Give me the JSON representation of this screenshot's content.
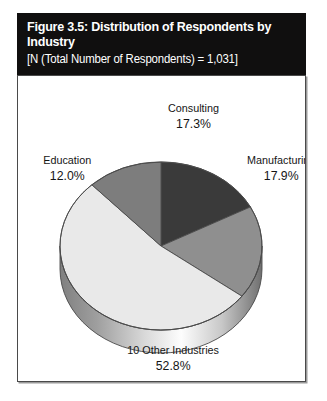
{
  "figure": {
    "title": "Figure 3.5: Distribution of Respondents by Industry",
    "subtitle": "[N (Total Number of Respondents) = 1,031]",
    "header_bg": "#100f0f",
    "header_fg": "#ffffff",
    "frame_border": "#4a4a4a",
    "frame_bg": "#ffffff"
  },
  "chart_data": {
    "type": "pie",
    "title": "Figure 3.5: Distribution of Respondents by Industry",
    "subtitle": "[N (Total Number of Respondents) = 1,031]",
    "total_n": 1031,
    "three_d": true,
    "legend": "none",
    "labels_position": "outside",
    "categories": [
      "Consulting",
      "Manufacturing",
      "10 Other Industries",
      "Education"
    ],
    "values": [
      17.3,
      17.9,
      52.8,
      12.0
    ],
    "value_labels": [
      "17.3%",
      "17.9%",
      "52.8%",
      "12.0%"
    ],
    "colors": [
      "#3a3a3a",
      "#8f8f8f",
      "#e9e9e9",
      "#7d7d7d"
    ],
    "slices": [
      {
        "name": "Consulting",
        "value": 17.3,
        "value_label": "17.3%",
        "color": "#3a3a3a",
        "label_x": 164,
        "label_y": 36
      },
      {
        "name": "Manufacturing",
        "value": 17.9,
        "value_label": "17.9%",
        "color": "#8f8f8f",
        "label_x": 246,
        "label_y": 88
      },
      {
        "name": "10 Other Industries",
        "value": 52.8,
        "value_label": "52.8%",
        "color": "#e9e9e9",
        "label_x": 145,
        "label_y": 278
      },
      {
        "name": "Education",
        "value": 12.0,
        "value_label": "12.0%",
        "color": "#7d7d7d",
        "label_x": 46,
        "label_y": 88
      }
    ]
  }
}
